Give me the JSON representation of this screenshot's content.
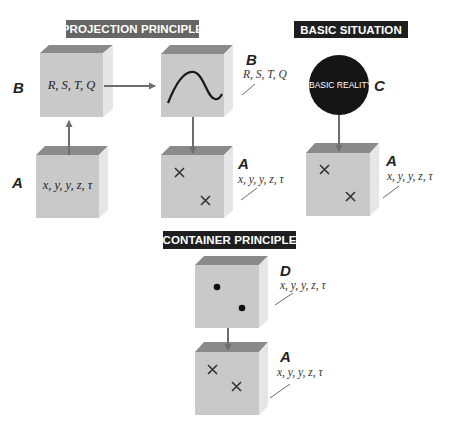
{
  "colors": {
    "projection_label_bg": "#666666",
    "basic_label_bg": "#1e1e1e",
    "container_label_bg": "#1e1e1e",
    "cube_front": "#c9c9c9",
    "cube_top": "#8a8a8a",
    "cube_side": "#e6e6e6",
    "circle_fill": "#151515",
    "arrow": "#6e6e6e"
  },
  "sections": {
    "projection": {
      "title": "PROJECTION PRINCIPLE"
    },
    "basic": {
      "title": "BASIC SITUATION"
    },
    "container": {
      "title": "CONTAINER PRINCIPLE"
    }
  },
  "projection": {
    "cube_b": {
      "letter": "B",
      "vars": "R, S, T, Q"
    },
    "cube_a": {
      "letter": "A",
      "vars": "x, y, y, z, τ"
    },
    "cube_b_curve": {
      "letter": "B",
      "vars": "R, S, T, Q"
    },
    "cube_a_crosses": {
      "letter": "A",
      "vars": "x, y, y, z, τ"
    }
  },
  "basic": {
    "circle": {
      "text": "BASIC REALITY",
      "letter": "C"
    },
    "cube_a": {
      "letter": "A",
      "vars": "x, y, y, z, τ"
    }
  },
  "container": {
    "cube_d": {
      "letter": "D",
      "vars": "x, y, y, z, τ"
    },
    "cube_a": {
      "letter": "A",
      "vars": "x, y, y, z, τ"
    }
  }
}
